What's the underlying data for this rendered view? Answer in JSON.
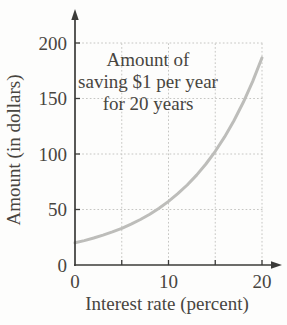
{
  "chart": {
    "title_lines": [
      "Amount of",
      "saving $1 per year",
      "for 20 years"
    ]
  },
  "chart_data": {
    "type": "line",
    "title": "Amount of saving $1 per year for 20 years",
    "xlabel": "Interest rate (percent)",
    "ylabel": "Amount (in dollars)",
    "xlim": [
      0,
      20
    ],
    "ylim": [
      0,
      200
    ],
    "x_tick_labels": [
      0,
      10,
      20
    ],
    "x_gridlines": [
      5,
      10,
      15,
      20
    ],
    "y_tick_labels": [
      0,
      50,
      100,
      150,
      200
    ],
    "y_gridlines": [
      50,
      100,
      150,
      200
    ],
    "grid_style": "dotted",
    "legend": "none",
    "series": [
      {
        "name": "future value of saving $1 per year for 20 years",
        "x": [
          0,
          1,
          2,
          3,
          4,
          5,
          6,
          7,
          8,
          9,
          10,
          11,
          12,
          13,
          14,
          15,
          16,
          17,
          18,
          19,
          20
        ],
        "y": [
          20,
          22.0,
          24.3,
          26.9,
          29.8,
          33.1,
          36.8,
          41.0,
          45.8,
          51.2,
          57.3,
          64.2,
          72.1,
          81.0,
          91.0,
          102.4,
          115.4,
          130.0,
          146.6,
          165.4,
          186.7
        ]
      }
    ],
    "colors": {
      "curve": "#bdbdba",
      "grid": "#c6c6c3",
      "axis": "#3b3b39",
      "text": "#48453f",
      "background": "#fdfdfc"
    }
  }
}
